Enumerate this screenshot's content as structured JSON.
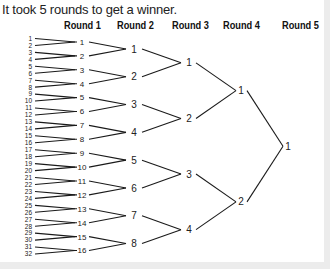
{
  "caption": "It took 5 rounds to get a winner.",
  "rounds": [
    {
      "label": "Round 1",
      "x": 64
    },
    {
      "label": "Round 2",
      "x": 117
    },
    {
      "label": "Round 3",
      "x": 172
    },
    {
      "label": "Round 4",
      "x": 223
    },
    {
      "label": "Round 5",
      "x": 282
    }
  ],
  "bracket": {
    "entrants": [
      1,
      2,
      3,
      4,
      5,
      6,
      7,
      8,
      9,
      10,
      11,
      12,
      13,
      14,
      15,
      16,
      17,
      18,
      19,
      20,
      21,
      22,
      23,
      24,
      25,
      26,
      27,
      28,
      29,
      30,
      31,
      32
    ],
    "round1_winners": [
      1,
      2,
      3,
      4,
      5,
      6,
      7,
      8,
      9,
      10,
      11,
      12,
      13,
      14,
      15,
      16
    ],
    "round2_winners": [
      1,
      2,
      3,
      4,
      5,
      6,
      7,
      8
    ],
    "round3_winners": [
      1,
      2,
      3,
      4
    ],
    "round4_winners": [
      1,
      2
    ],
    "champion": [
      1
    ]
  },
  "colors": {
    "line": "#1a1a1a",
    "text": "#222222",
    "strip": "#ececec"
  }
}
